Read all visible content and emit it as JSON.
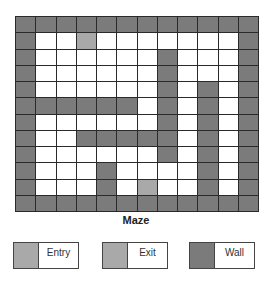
{
  "title": "Maze",
  "colors": {
    "wall": "#7b7b7b",
    "entry": "#a9a9a9",
    "exit": "#a9a9a9",
    "open": "#ffffff",
    "grid_line": "#2a2a2a"
  },
  "maze": {
    "rows": 12,
    "cols": 12,
    "legend_codes": {
      "W": "Wall",
      "E": "Entry",
      "X": "Exit",
      ".": "Open"
    },
    "grid": [
      "WWWWWWWWWWWW",
      "W..E.......W",
      "W......W...W",
      "W......W...W",
      "W......W.W.W",
      "WWWWWW.W.W.W",
      "W......W.W.W",
      "W..WWWWW.W.W",
      "W......W.W.W",
      "W...W....W.W",
      "W...W.X..W.W",
      "WWWWWWWWWWWW"
    ],
    "entry": {
      "row": 1,
      "col": 3
    },
    "exit": {
      "row": 10,
      "col": 6
    }
  },
  "legend": [
    {
      "label": "Entry",
      "color": "#a9a9a9"
    },
    {
      "label": "Exit",
      "color": "#a9a9a9"
    },
    {
      "label": "Wall",
      "color": "#7b7b7b"
    }
  ]
}
